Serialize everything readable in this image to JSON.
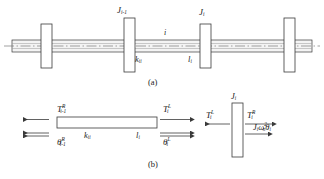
{
  "figure": {
    "title_hidden": "Torsional shaft-disc system and free body diagrams",
    "panel_a": {
      "caption": "(a)",
      "labels": {
        "disc_left": {
          "base": "J",
          "sub": "i-1"
        },
        "disc_right": {
          "base": "J",
          "sub": "i"
        },
        "segment_index": {
          "base": "i",
          "sub": ""
        },
        "stiffness": {
          "base": "k",
          "sub": "ii"
        },
        "length": {
          "base": "l",
          "sub": "i"
        }
      }
    },
    "panel_b": {
      "caption": "(b)",
      "shaft_element": {
        "torque_left": {
          "base": "T",
          "sup": "R",
          "sub": "i-1"
        },
        "angle_left": {
          "base": "θ",
          "sup": "R",
          "sub": "i-1"
        },
        "torque_right": {
          "base": "T",
          "sup": "L",
          "sub": "i"
        },
        "angle_right": {
          "base": "θ",
          "sup": "L",
          "sub": "i"
        },
        "stiffness": {
          "base": "k",
          "sub": "ii"
        },
        "length": {
          "base": "l",
          "sub": "i"
        }
      },
      "disc_element": {
        "disc": {
          "base": "J",
          "sub": "i"
        },
        "torque_left": {
          "base": "T",
          "sup": "L",
          "sub": "i"
        },
        "torque_right": {
          "base": "T",
          "sup": "R",
          "sub": "i"
        },
        "inertia_force": {
          "base": "J",
          "sub": "i",
          "omega": "ω",
          "omega_sup": "2",
          "omega_sub": "n",
          "theta": "θ",
          "theta_sub": "i"
        }
      }
    }
  },
  "colors": {
    "line": "#3a3a3a",
    "centerline": "#7a7a7a",
    "shaft_fill": "#f2f2f2",
    "disc_fill": "#ffffff",
    "background": "#ffffff",
    "text": "#1c1c1c"
  }
}
